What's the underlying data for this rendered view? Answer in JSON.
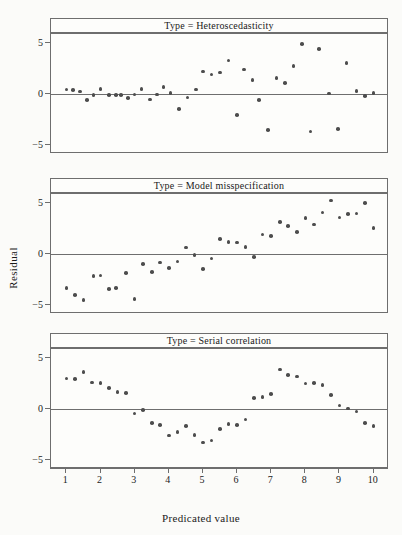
{
  "chart_data": {
    "type": "scatter",
    "title": "",
    "xlabel": "Predicated value",
    "ylabel": "Residual",
    "xlim": [
      0.55,
      10.45
    ],
    "ylim": [
      -5.9,
      5.9
    ],
    "xticks": [
      1,
      2,
      3,
      4,
      5,
      6,
      7,
      8,
      9,
      10
    ],
    "yticks": [
      5,
      0,
      -5
    ],
    "grid": false,
    "legend": "none",
    "reference_line_y": 0,
    "point_color": "#4d4d4d",
    "axis_color": "#6e6e6e",
    "panels": [
      {
        "strip_label": "Type = Heteroscedasticity",
        "x": [
          1.0,
          1.2,
          1.4,
          1.6,
          1.8,
          2.0,
          2.25,
          2.45,
          2.6,
          2.8,
          3.0,
          3.2,
          3.45,
          3.65,
          3.85,
          4.05,
          4.3,
          4.55,
          4.8,
          5.0,
          5.25,
          5.5,
          5.75,
          6.0,
          6.2,
          6.45,
          6.65,
          6.9,
          7.15,
          7.4,
          7.65,
          7.9,
          8.15,
          8.4,
          8.7,
          8.95,
          9.2,
          9.5,
          9.75,
          10.0
        ],
        "y": [
          0.45,
          0.4,
          0.25,
          -0.6,
          -0.1,
          0.5,
          -0.1,
          -0.08,
          -0.12,
          -0.42,
          -0.05,
          0.5,
          -0.55,
          -0.05,
          0.7,
          0.1,
          -1.5,
          -0.35,
          0.45,
          2.2,
          1.9,
          2.1,
          3.3,
          -2.05,
          2.4,
          1.35,
          -0.6,
          -3.55,
          1.55,
          1.1,
          2.75,
          4.9,
          -3.7,
          4.45,
          0.05,
          -3.45,
          3.05,
          0.3,
          -0.2,
          0.1
        ]
      },
      {
        "strip_label": "Type = Model misspecification",
        "x": [
          1.0,
          1.25,
          1.5,
          1.8,
          2.0,
          2.25,
          2.45,
          2.75,
          3.0,
          3.25,
          3.5,
          3.75,
          4.0,
          4.25,
          4.5,
          4.75,
          5.0,
          5.25,
          5.5,
          5.75,
          6.0,
          6.25,
          6.5,
          6.75,
          7.0,
          7.25,
          7.5,
          7.75,
          8.0,
          8.25,
          8.5,
          8.75,
          9.0,
          9.25,
          9.5,
          9.75,
          10.0
        ],
        "y": [
          -3.35,
          -4.05,
          -4.55,
          -2.15,
          -2.1,
          -3.45,
          -3.35,
          -1.85,
          -4.45,
          -1.0,
          -1.75,
          -0.85,
          -1.35,
          -0.75,
          0.65,
          -0.1,
          -1.45,
          -0.45,
          1.45,
          1.2,
          1.15,
          0.7,
          -0.3,
          1.9,
          1.75,
          3.15,
          2.75,
          2.15,
          3.55,
          2.9,
          4.1,
          5.25,
          3.6,
          3.95,
          4.0,
          5.0,
          2.55
        ]
      },
      {
        "strip_label": "Type = Serial correlation",
        "x": [
          1.0,
          1.25,
          1.5,
          1.75,
          2.0,
          2.25,
          2.5,
          2.75,
          3.0,
          3.25,
          3.5,
          3.75,
          4.0,
          4.25,
          4.5,
          4.75,
          5.0,
          5.25,
          5.5,
          5.75,
          6.0,
          6.25,
          6.5,
          6.75,
          7.0,
          7.25,
          7.5,
          7.75,
          8.0,
          8.25,
          8.5,
          8.75,
          9.0,
          9.25,
          9.5,
          9.75,
          10.0
        ],
        "y": [
          3.0,
          2.95,
          3.65,
          2.6,
          2.55,
          2.05,
          1.65,
          1.6,
          -0.45,
          -0.1,
          -1.35,
          -1.6,
          -2.6,
          -2.25,
          -1.7,
          -2.55,
          -3.3,
          -3.1,
          -1.95,
          -1.45,
          -1.55,
          -1.05,
          1.1,
          1.2,
          1.45,
          3.9,
          3.35,
          3.2,
          2.5,
          2.55,
          2.35,
          1.4,
          0.35,
          0.05,
          -0.25,
          -1.4,
          -1.7
        ]
      }
    ]
  },
  "axis": {
    "ylabel": "Residual",
    "xlabel": "Predicated value",
    "ytick_labels": [
      "5",
      "0",
      "−5"
    ],
    "xtick_labels": [
      "1",
      "2",
      "3",
      "4",
      "5",
      "6",
      "7",
      "8",
      "9",
      "10"
    ]
  }
}
